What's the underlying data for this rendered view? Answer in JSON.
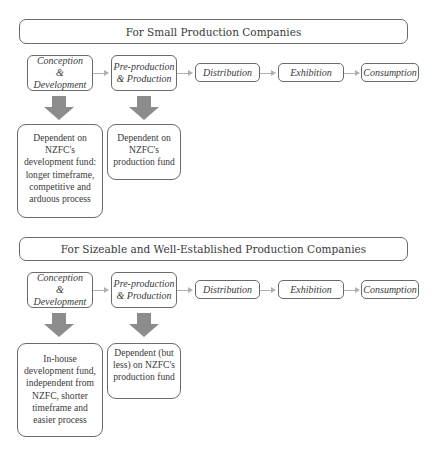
{
  "sections": [
    {
      "title": "For Small Production Companies",
      "stages": [
        {
          "label": "Conception & Development"
        },
        {
          "label": "Pre-production & Production"
        },
        {
          "label": "Distribution"
        },
        {
          "label": "Exhibition"
        },
        {
          "label": "Consumption"
        }
      ],
      "descriptions": [
        {
          "stage": "Conception & Development",
          "text": "Dependent on NZFC's development fund: longer timeframe, competitive and arduous process"
        },
        {
          "stage": "Pre-production & Production",
          "text": "Dependent on NZFC's production fund"
        }
      ]
    },
    {
      "title": "For Sizeable and Well-Established Production Companies",
      "stages": [
        {
          "label": "Conception & Development"
        },
        {
          "label": "Pre-production & Production"
        },
        {
          "label": "Distribution"
        },
        {
          "label": "Exhibition"
        },
        {
          "label": "Consumption"
        }
      ],
      "descriptions": [
        {
          "stage": "Conception & Development",
          "text": "In-house development fund, independent from NZFC, shorter timeframe and easier process"
        },
        {
          "stage": "Pre-production & Production",
          "text": "Dependent (but less) on NZFC's production fund"
        }
      ]
    }
  ],
  "colors": {
    "border": "#6a6a6a",
    "connector": "#b0b0b0",
    "down_arrow": "#8c8c8c",
    "text": "#3a3a3a"
  }
}
